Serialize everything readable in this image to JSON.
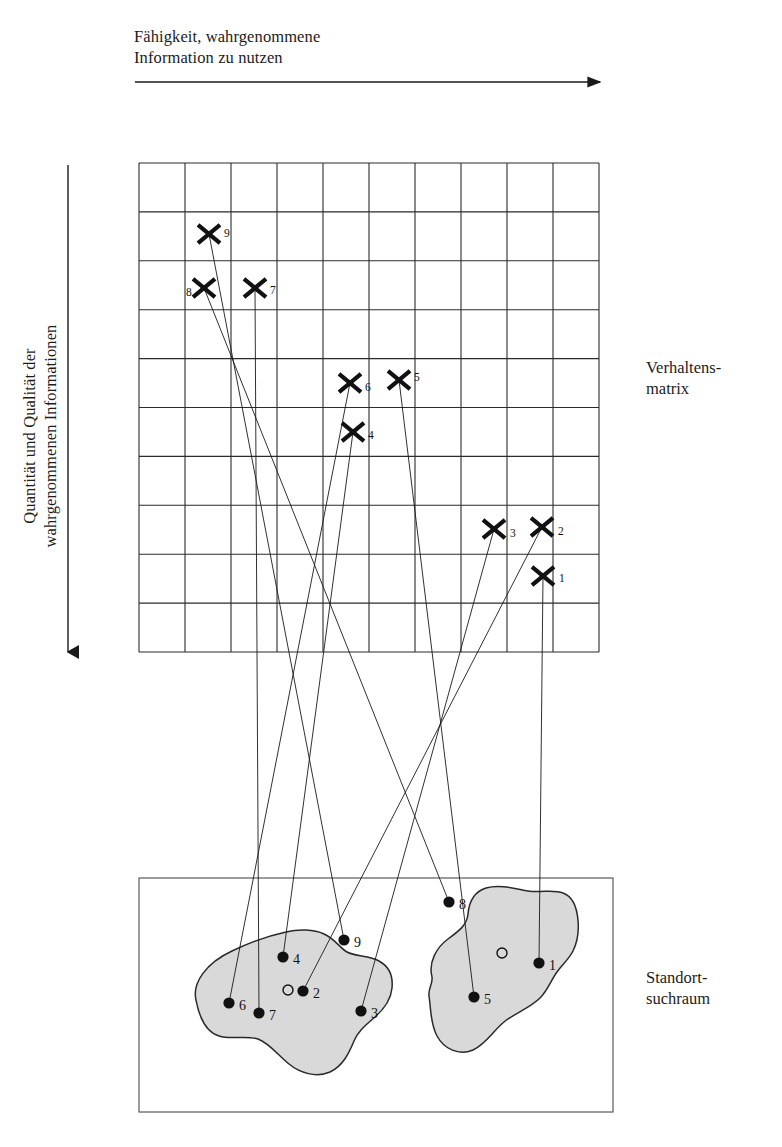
{
  "diagram": {
    "title_top_axis": "Fähigkeit, wahrgenommene\nInformation zu nutzen",
    "title_left_axis": "Quantität und Qualität der\nwahrgenommenen Informationen",
    "label_matrix": "Verhaltens-\nmatrix",
    "label_space": "Standort-\nsuchraum",
    "colors": {
      "stroke": "#1a1a1a",
      "blob_fill": "#d9d9d9",
      "blob_stroke": "#2a2a2a",
      "grid": "#2b2b2b",
      "background": "#ffffff"
    },
    "grid": {
      "x": 139,
      "y": 163,
      "width": 460,
      "height": 489,
      "cols": 10,
      "rows": 10
    },
    "top_arrow": {
      "x1": 135,
      "y1": 82,
      "x2": 600,
      "y2": 82
    },
    "left_arrow": {
      "x1": 68,
      "y1": 165,
      "x2": 68,
      "y2": 652
    },
    "lower_box": {
      "x": 139,
      "y": 878,
      "width": 474,
      "height": 234
    },
    "matrix_markers": [
      {
        "id": "1",
        "x": 543,
        "y": 576,
        "label": "1",
        "lx": 559,
        "ly": 582
      },
      {
        "id": "2",
        "x": 542,
        "y": 527,
        "label": "2",
        "lx": 558,
        "ly": 535
      },
      {
        "id": "3",
        "x": 494,
        "y": 529,
        "label": "3",
        "lx": 510,
        "ly": 537
      },
      {
        "id": "4",
        "x": 353,
        "y": 432,
        "label": "4",
        "lx": 368,
        "ly": 439
      },
      {
        "id": "5",
        "x": 399,
        "y": 380,
        "label": "5",
        "lx": 414,
        "ly": 381
      },
      {
        "id": "6",
        "x": 350,
        "y": 383,
        "label": "6",
        "lx": 365,
        "ly": 391
      },
      {
        "id": "7",
        "x": 255,
        "y": 288,
        "label": "7",
        "lx": 270,
        "ly": 294
      },
      {
        "id": "8",
        "x": 204,
        "y": 288,
        "label": "8",
        "lx": 186,
        "ly": 296
      },
      {
        "id": "9",
        "x": 209,
        "y": 234,
        "label": "9",
        "lx": 224,
        "ly": 237
      }
    ],
    "site_points": [
      {
        "id": "1",
        "x": 539,
        "y": 963,
        "label": "1",
        "lx": 549,
        "ly": 970
      },
      {
        "id": "2",
        "x": 303,
        "y": 991,
        "label": "2",
        "lx": 313,
        "ly": 998
      },
      {
        "id": "3",
        "x": 361,
        "y": 1011,
        "label": "3",
        "lx": 371,
        "ly": 1018
      },
      {
        "id": "4",
        "x": 283,
        "y": 957,
        "label": "4",
        "lx": 293,
        "ly": 964
      },
      {
        "id": "5",
        "x": 474,
        "y": 997,
        "label": "5",
        "lx": 484,
        "ly": 1004
      },
      {
        "id": "6",
        "x": 229,
        "y": 1003,
        "label": "6",
        "lx": 239,
        "ly": 1010
      },
      {
        "id": "7",
        "x": 259,
        "y": 1013,
        "label": "7",
        "lx": 269,
        "ly": 1020
      },
      {
        "id": "8",
        "x": 449,
        "y": 902,
        "label": "8",
        "lx": 459,
        "ly": 909
      },
      {
        "id": "9",
        "x": 344,
        "y": 940,
        "label": "9",
        "lx": 354,
        "ly": 947
      }
    ],
    "hollow_circles": [
      {
        "x": 288,
        "y": 990,
        "r": 5
      },
      {
        "x": 502,
        "y": 953,
        "r": 5
      }
    ],
    "connectors": [
      {
        "from": "X1",
        "to": "P1",
        "x1": 543,
        "y1": 576,
        "x2": 539,
        "y2": 963
      },
      {
        "from": "X2",
        "to": "P2",
        "x1": 542,
        "y1": 527,
        "x2": 303,
        "y2": 991
      },
      {
        "from": "X3",
        "to": "P3",
        "x1": 494,
        "y1": 529,
        "x2": 361,
        "y2": 1011
      },
      {
        "from": "X4",
        "to": "P4",
        "x1": 353,
        "y1": 432,
        "x2": 283,
        "y2": 957
      },
      {
        "from": "X5",
        "to": "P5",
        "x1": 399,
        "y1": 380,
        "x2": 474,
        "y2": 997
      },
      {
        "from": "X6",
        "to": "P6",
        "x1": 350,
        "y1": 383,
        "x2": 229,
        "y2": 1003
      },
      {
        "from": "X7",
        "to": "P7",
        "x1": 255,
        "y1": 288,
        "x2": 259,
        "y2": 1013
      },
      {
        "from": "X8",
        "to": "P8",
        "x1": 204,
        "y1": 288,
        "x2": 449,
        "y2": 902
      },
      {
        "from": "X9",
        "to": "P9",
        "x1": 209,
        "y1": 234,
        "x2": 344,
        "y2": 940
      }
    ],
    "blob_left_path": "M 196 1000 C 192 983 206 963 232 951 C 255 940 272 935 286 932 C 298 929 314 929 324 934 C 335 939 340 948 347 952 C 356 957 369 955 379 961 C 390 967 393 978 392 988 C 391 1000 383 1010 375 1017 C 366 1025 358 1031 354 1041 C 349 1053 343 1066 330 1072 C 316 1078 300 1073 289 1064 C 278 1055 269 1043 258 1039 C 246 1035 231 1040 219 1036 C 206 1032 199 1016 196 1000 Z",
    "blob_right_path": "M 432 977 C 428 962 437 947 448 939 C 459 931 467 925 468 914 C 469 903 473 892 486 888 C 500 884 516 889 528 891 C 541 893 553 889 563 893 C 574 897 577 909 578 920 C 579 931 577 943 573 951 C 569 959 562 965 557 972 C 551 980 548 990 540 998 C 530 1008 515 1013 504 1022 C 493 1031 486 1044 473 1050 C 459 1056 444 1049 437 1036 C 430 1023 431 1008 429 996 C 428 988 433 984 432 977 Z"
  }
}
